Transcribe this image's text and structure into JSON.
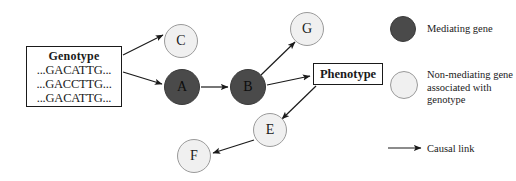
{
  "diagram": {
    "genotype": {
      "title": "Genotype",
      "sequences": [
        "...GACATTG...",
        "...GACCTTG...",
        "...GACATTG..."
      ]
    },
    "phenotype": {
      "label": "Phenotype"
    },
    "nodes": [
      {
        "id": "C",
        "label": "C",
        "kind": "non-mediating"
      },
      {
        "id": "A",
        "label": "A",
        "kind": "mediating"
      },
      {
        "id": "B",
        "label": "B",
        "kind": "mediating"
      },
      {
        "id": "G",
        "label": "G",
        "kind": "non-mediating"
      },
      {
        "id": "E",
        "label": "E",
        "kind": "non-mediating"
      },
      {
        "id": "F",
        "label": "F",
        "kind": "non-mediating"
      }
    ],
    "edges": [
      {
        "from": "Genotype",
        "to": "C"
      },
      {
        "from": "Genotype",
        "to": "A"
      },
      {
        "from": "A",
        "to": "B"
      },
      {
        "from": "B",
        "to": "G"
      },
      {
        "from": "B",
        "to": "Phenotype"
      },
      {
        "from": "Phenotype",
        "to": "E"
      },
      {
        "from": "E",
        "to": "F"
      }
    ]
  },
  "legend": {
    "mediating_label": "Mediating gene",
    "non_mediating_label": "Non-mediating gene associated with genotype",
    "causal_link_label": "Causal link"
  },
  "colors": {
    "mediating": "#4a4a4a",
    "non_mediating": "#f0f0f0",
    "stroke": "#1a1a1a"
  }
}
